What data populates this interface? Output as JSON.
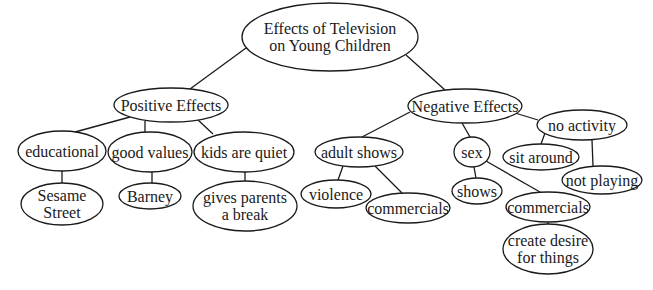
{
  "diagram": {
    "type": "concept-map",
    "root": {
      "id": "root",
      "lines": [
        "Effects of Television",
        "on Young Children"
      ]
    },
    "nodes": [
      {
        "id": "root",
        "lines": [
          "Effects of Television",
          "on Young Children"
        ],
        "cx": 330,
        "cy": 37,
        "rx": 88,
        "ry": 34,
        "fs": 16
      },
      {
        "id": "positive",
        "lines": [
          "Positive Effects"
        ],
        "cx": 171,
        "cy": 105,
        "rx": 57,
        "ry": 17,
        "fs": 16
      },
      {
        "id": "educational",
        "lines": [
          "educational"
        ],
        "cx": 62,
        "cy": 151,
        "rx": 44,
        "ry": 20,
        "fs": 16
      },
      {
        "id": "good-values",
        "lines": [
          "good values"
        ],
        "cx": 150,
        "cy": 152,
        "rx": 42,
        "ry": 20,
        "fs": 16
      },
      {
        "id": "kids-quiet",
        "lines": [
          "kids are quiet"
        ],
        "cx": 244,
        "cy": 152,
        "rx": 50,
        "ry": 20,
        "fs": 16
      },
      {
        "id": "sesame",
        "lines": [
          "Sesame",
          "Street"
        ],
        "cx": 62,
        "cy": 204,
        "rx": 41,
        "ry": 21,
        "fs": 16
      },
      {
        "id": "barney",
        "lines": [
          "Barney"
        ],
        "cx": 150,
        "cy": 196,
        "rx": 31,
        "ry": 13,
        "fs": 16
      },
      {
        "id": "parents-break",
        "lines": [
          "gives parents",
          "a break"
        ],
        "cx": 245,
        "cy": 206,
        "rx": 52,
        "ry": 25,
        "fs": 16
      },
      {
        "id": "negative",
        "lines": [
          "Negative Effects"
        ],
        "cx": 465,
        "cy": 106,
        "rx": 57,
        "ry": 17,
        "fs": 16
      },
      {
        "id": "adult-shows",
        "lines": [
          "adult shows"
        ],
        "cx": 359,
        "cy": 152,
        "rx": 44,
        "ry": 15,
        "fs": 16
      },
      {
        "id": "sex",
        "lines": [
          "sex"
        ],
        "cx": 472,
        "cy": 152,
        "rx": 18,
        "ry": 15,
        "fs": 16
      },
      {
        "id": "no-activity",
        "lines": [
          "no activity"
        ],
        "cx": 582,
        "cy": 125,
        "rx": 45,
        "ry": 15,
        "fs": 16
      },
      {
        "id": "sit-around",
        "lines": [
          "sit around"
        ],
        "cx": 541,
        "cy": 157,
        "rx": 38,
        "ry": 13,
        "fs": 16
      },
      {
        "id": "not-playing",
        "lines": [
          "not playing"
        ],
        "cx": 602,
        "cy": 180,
        "rx": 40,
        "ry": 14,
        "fs": 16
      },
      {
        "id": "violence",
        "lines": [
          "violence"
        ],
        "cx": 336,
        "cy": 194,
        "rx": 35,
        "ry": 14,
        "fs": 16
      },
      {
        "id": "commercials-adult",
        "lines": [
          "commercials"
        ],
        "cx": 408,
        "cy": 208,
        "rx": 42,
        "ry": 15,
        "fs": 16
      },
      {
        "id": "shows",
        "lines": [
          "shows"
        ],
        "cx": 477,
        "cy": 191,
        "rx": 25,
        "ry": 13,
        "fs": 16
      },
      {
        "id": "commercials-sex",
        "lines": [
          "commercials"
        ],
        "cx": 548,
        "cy": 207,
        "rx": 42,
        "ry": 15,
        "fs": 16
      },
      {
        "id": "create-desire",
        "lines": [
          "create desire",
          "for things"
        ],
        "cx": 548,
        "cy": 249,
        "rx": 45,
        "ry": 25,
        "fs": 16
      }
    ],
    "edges": [
      {
        "from": "root",
        "to": "positive",
        "x1": 246,
        "y1": 48,
        "x2": 190,
        "y2": 89
      },
      {
        "from": "root",
        "to": "negative",
        "x1": 406,
        "y1": 55,
        "x2": 445,
        "y2": 90
      },
      {
        "from": "positive",
        "to": "educational",
        "x1": 130,
        "y1": 117,
        "x2": 75,
        "y2": 132
      },
      {
        "from": "positive",
        "to": "good-values",
        "x1": 145,
        "y1": 121,
        "x2": 145,
        "y2": 132
      },
      {
        "from": "positive",
        "to": "kids-quiet",
        "x1": 198,
        "y1": 120,
        "x2": 213,
        "y2": 134
      },
      {
        "from": "educational",
        "to": "sesame",
        "x1": 62,
        "y1": 171,
        "x2": 62,
        "y2": 183
      },
      {
        "from": "good-values",
        "to": "barney",
        "x1": 152,
        "y1": 172,
        "x2": 152,
        "y2": 183
      },
      {
        "from": "kids-quiet",
        "to": "parents-break",
        "x1": 245,
        "y1": 172,
        "x2": 245,
        "y2": 181
      },
      {
        "from": "negative",
        "to": "adult-shows",
        "x1": 410,
        "y1": 112,
        "x2": 362,
        "y2": 137
      },
      {
        "from": "negative",
        "to": "sex",
        "x1": 462,
        "y1": 123,
        "x2": 470,
        "y2": 137
      },
      {
        "from": "negative",
        "to": "no-activity",
        "x1": 515,
        "y1": 113,
        "x2": 538,
        "y2": 120
      },
      {
        "from": "adult-shows",
        "to": "violence",
        "x1": 343,
        "y1": 166,
        "x2": 338,
        "y2": 180
      },
      {
        "from": "adult-shows",
        "to": "commercials-adult",
        "x1": 375,
        "y1": 166,
        "x2": 402,
        "y2": 193
      },
      {
        "from": "sex",
        "to": "shows",
        "x1": 474,
        "y1": 167,
        "x2": 476,
        "y2": 178
      },
      {
        "from": "sex",
        "to": "commercials-sex",
        "x1": 486,
        "y1": 161,
        "x2": 540,
        "y2": 192
      },
      {
        "from": "no-activity",
        "to": "sit-around",
        "x1": 545,
        "y1": 133,
        "x2": 541,
        "y2": 144
      },
      {
        "from": "no-activity",
        "to": "not-playing",
        "x1": 592,
        "y1": 140,
        "x2": 593,
        "y2": 166
      },
      {
        "from": "commercials-sex",
        "to": "create-desire",
        "x1": 548,
        "y1": 222,
        "x2": 548,
        "y2": 224
      }
    ]
  }
}
